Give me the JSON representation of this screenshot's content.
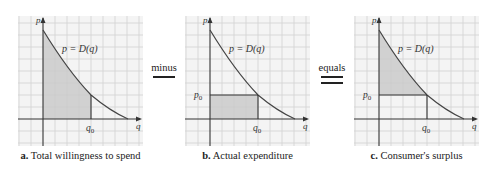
{
  "figure": {
    "panels": [
      {
        "id": "a",
        "letter": "a.",
        "caption": "Total willingness to spend",
        "curve_label": "p = D(q)",
        "x_axis_label": "q",
        "y_axis_label": "p",
        "q_marker": "q0",
        "p_marker": "",
        "shaded_region": "area under demand curve from 0 to q0"
      },
      {
        "id": "b",
        "letter": "b.",
        "caption": "Actual expenditure",
        "curve_label": "p = D(q)",
        "x_axis_label": "q",
        "y_axis_label": "p",
        "q_marker": "q0",
        "p_marker": "p0",
        "shaded_region": "rectangle 0..q0 by 0..p0"
      },
      {
        "id": "c",
        "letter": "c.",
        "caption": "Consumer's surplus",
        "curve_label": "p = D(q)",
        "x_axis_label": "q",
        "y_axis_label": "p",
        "q_marker": "q0",
        "p_marker": "p0",
        "shaded_region": "area between demand curve and p0 from 0 to q0"
      }
    ],
    "operators": {
      "minus": "minus",
      "equals": "equals"
    },
    "colors": {
      "grid": "#cfcfcf",
      "background": "#f4f4f4",
      "shade": "#c8c8c8",
      "curve": "#444444",
      "axis": "#333333"
    }
  }
}
